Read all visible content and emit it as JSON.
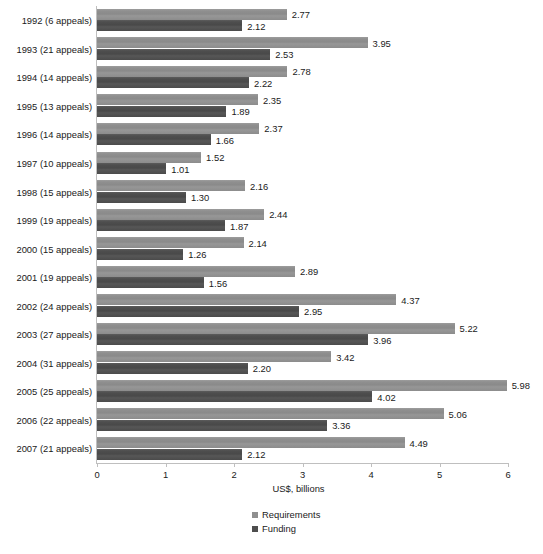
{
  "chart_data": {
    "type": "bar",
    "orientation": "horizontal",
    "title": "",
    "subtitle": "",
    "xlabel": "US$, billions",
    "ylabel": "",
    "xlim": [
      0,
      6
    ],
    "xticks": [
      0,
      1,
      2,
      3,
      4,
      5,
      6
    ],
    "xtick_labels": [
      "0",
      "1",
      "2",
      "3",
      "4",
      "5",
      "6"
    ],
    "grid": false,
    "legend_position": "bottom-center",
    "categories": [
      "1992 (6 appeals)",
      "1993 (21 appeals)",
      "1994 (14 appeals)",
      "1995 (13 appeals)",
      "1996 (14 appeals)",
      "1997 (10 appeals)",
      "1998 (15 appeals)",
      "1999 (19 appeals)",
      "2000 (15 appeals)",
      "2001 (19 appeals)",
      "2002 (24 appeals)",
      "2003 (27 appeals)",
      "2004 (31 appeals)",
      "2005 (25 appeals)",
      "2006 (22 appeals)",
      "2007 (21 appeals)"
    ],
    "series": [
      {
        "name": "Requirements",
        "color": "#8f8f8f",
        "values": [
          2.77,
          3.95,
          2.78,
          2.35,
          2.37,
          1.52,
          2.16,
          2.44,
          2.14,
          2.89,
          4.37,
          5.22,
          3.42,
          5.98,
          5.06,
          4.49
        ],
        "labels": [
          "2.77",
          "3.95",
          "2.78",
          "2.35",
          "2.37",
          "1.52",
          "2.16",
          "2.44",
          "2.14",
          "2.89",
          "4.37",
          "5.22",
          "3.42",
          "5.98",
          "5.06",
          "4.49"
        ]
      },
      {
        "name": "Funding",
        "color": "#4e4e4e",
        "values": [
          2.12,
          2.53,
          2.22,
          1.89,
          1.66,
          1.01,
          1.3,
          1.87,
          1.26,
          1.56,
          2.95,
          3.96,
          2.2,
          4.02,
          3.36,
          2.12
        ],
        "labels": [
          "2.12",
          "2.53",
          "2.22",
          "1.89",
          "1.66",
          "1.01",
          "1.30",
          "1.87",
          "1.26",
          "1.56",
          "2.95",
          "3.96",
          "2.20",
          "4.02",
          "3.36",
          "2.12"
        ]
      }
    ]
  },
  "legend": {
    "items": [
      {
        "label": "Requirements",
        "color": "#8f8f8f"
      },
      {
        "label": "Funding",
        "color": "#4e4e4e"
      }
    ]
  },
  "axis": {
    "x_title": "US$, billions"
  }
}
